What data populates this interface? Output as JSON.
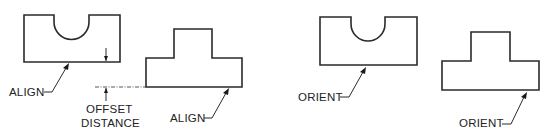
{
  "diagram": {
    "panels": [
      {
        "name": "align-panel",
        "labels": {
          "align_top": "ALIGN",
          "align_bottom": "ALIGN",
          "offset_line1": "OFFSET",
          "offset_line2": "DISTANCE"
        },
        "shapes": [
          "u-notch-block",
          "t-block"
        ]
      },
      {
        "name": "orient-panel",
        "labels": {
          "orient_top": "ORIENT",
          "orient_bottom": "ORIENT"
        },
        "shapes": [
          "u-notch-block",
          "t-block"
        ]
      }
    ],
    "colors": {
      "stroke": "#2a2a2a",
      "background": "#ffffff"
    }
  }
}
